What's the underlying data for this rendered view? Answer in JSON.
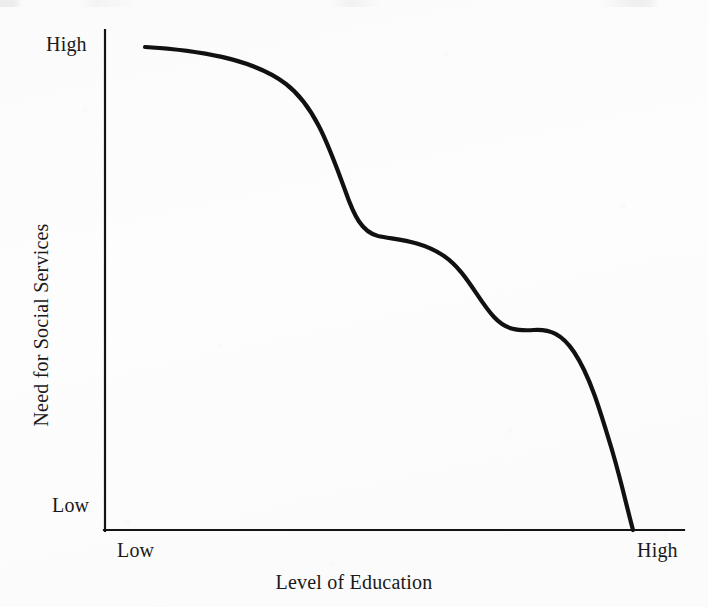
{
  "figure": {
    "background_color": "#fdfdfd",
    "ink_color": "#111111",
    "medium": "scanned-book-figure"
  },
  "chart_data": {
    "type": "line",
    "title": "",
    "subtitle": "",
    "xlabel": "Level of Education",
    "ylabel": "Need for Social Services",
    "grid": false,
    "legend": null,
    "legend_position": "none",
    "annotations": [],
    "x_axis": {
      "label": "Level of Education",
      "tick_labels": [
        "Low",
        "High"
      ],
      "tick_low": "Low",
      "tick_high": "High",
      "range": [
        0,
        100
      ],
      "type": "ordinal-qualitative"
    },
    "y_axis": {
      "label": "Need for Social Services",
      "tick_labels": [
        "Low",
        "High"
      ],
      "tick_low": "Low",
      "tick_high": "High",
      "range": [
        0,
        100
      ],
      "type": "ordinal-qualitative"
    },
    "series": [
      {
        "name": "Need for Social Services",
        "style": "smooth-descending-staircase",
        "color": "#111111",
        "line_width": 4,
        "x": [
          8,
          16,
          24,
          31,
          36,
          40,
          44,
          47,
          50,
          54,
          58,
          62,
          66,
          70,
          73,
          76,
          79,
          82,
          85,
          88,
          91,
          94,
          97,
          100
        ],
        "values": [
          96,
          95,
          93,
          90,
          85,
          78,
          69,
          61,
          57,
          56,
          55,
          53,
          49,
          43,
          40,
          39,
          38,
          36,
          31,
          24,
          17,
          11,
          5,
          0
        ]
      }
    ]
  },
  "curve_geometry": {
    "start_point": [
      145,
      47
    ],
    "end_point": [
      633,
      530
    ],
    "plateau_1": [
      385,
      237
    ],
    "plateau_2": [
      532,
      330
    ],
    "path": "M 145 47 C 196 50, 252 58, 286 84 C 316 107, 330 150, 345 190 C 354 216, 362 232, 378 236 C 396 240, 420 240, 444 256 C 466 271, 478 300, 494 317 C 506 330, 518 331, 534 330 C 550 329, 562 334, 574 352 C 590 376, 600 410, 612 450 C 622 484, 628 512, 633 530"
  },
  "axes_geometry": {
    "y_axis_x": 105,
    "y_axis_top": 30,
    "y_axis_bottom": 530,
    "x_axis_y": 530,
    "x_axis_left": 105,
    "x_axis_right": 684,
    "axis_line_width": 2
  }
}
